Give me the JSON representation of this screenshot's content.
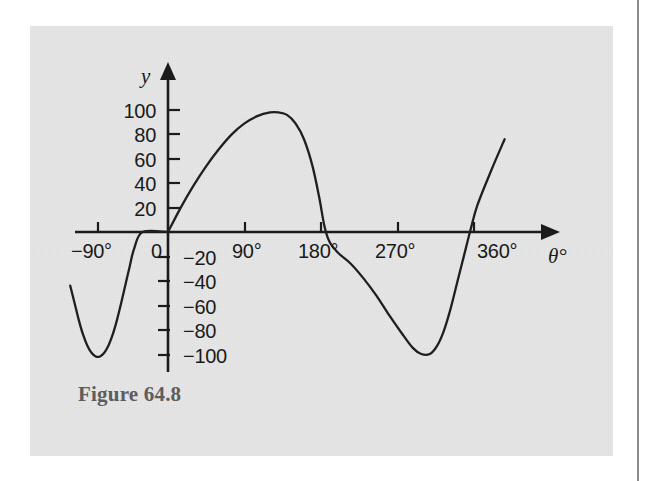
{
  "figure": {
    "caption": "Figure 64.8",
    "panel_color": "#e7e7e7",
    "ink_color": "#1b1b1b",
    "caption_color": "#5d5d5d"
  },
  "chart_data": {
    "type": "line",
    "title": "Figure 64.8",
    "xlabel": "θ°",
    "ylabel": "y",
    "xlim": [
      -135,
      405
    ],
    "ylim": [
      -115,
      112
    ],
    "grid": false,
    "legend": null,
    "x_axis": {
      "name": "θ°",
      "tick_labels": [
        "−90°",
        "0",
        "90°",
        "180°",
        "270°",
        "360°"
      ],
      "tick_values": [
        -90,
        0,
        90,
        180,
        270,
        360
      ],
      "arrow": true
    },
    "y_axis": {
      "name": "y",
      "tick_labels": [
        "100",
        "80",
        "60",
        "40",
        "20",
        "−20",
        "−40",
        "−60",
        "−80",
        "−100"
      ],
      "tick_values": [
        100,
        80,
        60,
        40,
        20,
        -20,
        -40,
        -60,
        -80,
        -100
      ],
      "arrow": true
    },
    "series": [
      {
        "name": "resultant waveform",
        "points": [
          [
            -115,
            -44
          ],
          [
            -110,
            -58
          ],
          [
            -105,
            -72
          ],
          [
            -100,
            -84
          ],
          [
            -95,
            -93
          ],
          [
            -90,
            -99
          ],
          [
            -85,
            -102
          ],
          [
            -80,
            -102
          ],
          [
            -75,
            -99
          ],
          [
            -70,
            -93
          ],
          [
            -65,
            -84
          ],
          [
            -60,
            -72
          ],
          [
            -55,
            -58
          ],
          [
            -50,
            -43
          ],
          [
            -45,
            -28
          ],
          [
            -40,
            -14
          ],
          [
            -30,
            0
          ],
          [
            0,
            0
          ],
          [
            15,
            20
          ],
          [
            30,
            38
          ],
          [
            45,
            54
          ],
          [
            60,
            68
          ],
          [
            75,
            80
          ],
          [
            90,
            89
          ],
          [
            105,
            95
          ],
          [
            120,
            98
          ],
          [
            130,
            98
          ],
          [
            140,
            96
          ],
          [
            150,
            89
          ],
          [
            160,
            76
          ],
          [
            170,
            54
          ],
          [
            178,
            28
          ],
          [
            184,
            5
          ],
          [
            190,
            -8
          ],
          [
            200,
            -17
          ],
          [
            215,
            -26
          ],
          [
            230,
            -38
          ],
          [
            245,
            -52
          ],
          [
            260,
            -68
          ],
          [
            275,
            -83
          ],
          [
            288,
            -95
          ],
          [
            298,
            -100
          ],
          [
            308,
            -100
          ],
          [
            316,
            -94
          ],
          [
            324,
            -82
          ],
          [
            332,
            -64
          ],
          [
            340,
            -42
          ],
          [
            348,
            -20
          ],
          [
            356,
            2
          ],
          [
            364,
            22
          ],
          [
            380,
            50
          ],
          [
            396,
            76
          ]
        ]
      }
    ]
  }
}
